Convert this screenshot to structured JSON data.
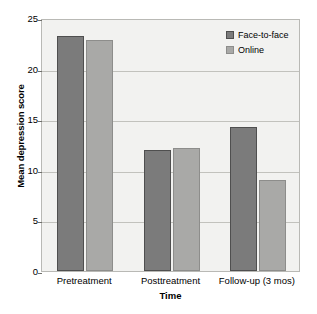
{
  "chart_data": {
    "type": "bar",
    "title": "",
    "xlabel": "Time",
    "ylabel": "Mean depression score",
    "categories": [
      "Pretreatment",
      "Posttreatment",
      "Follow-up (3 mos)"
    ],
    "series": [
      {
        "name": "Face-to-face",
        "values": [
          23.2,
          12.0,
          14.2
        ],
        "color": "#7b7b7b"
      },
      {
        "name": "Online",
        "values": [
          22.8,
          12.2,
          9.0
        ],
        "color": "#a9a9a7"
      }
    ],
    "ylim": [
      0,
      25
    ],
    "yticks": [
      0,
      5,
      10,
      15,
      20,
      25
    ],
    "ytick_labels": [
      "0",
      "5",
      "10",
      "15",
      "20",
      "25"
    ],
    "grid": true,
    "grid_axis": "y",
    "legend_position": "top-right",
    "plot_background": "#f2f2f0",
    "figure_background": "#ffffff",
    "grid_color": "#c2c2bd",
    "axis_color": "#b9b9b5"
  }
}
